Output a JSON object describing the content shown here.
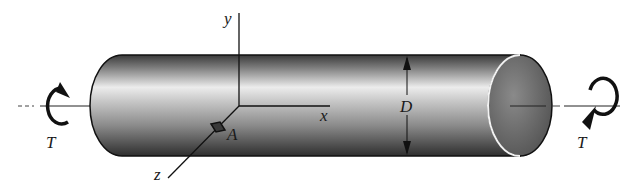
{
  "diagram": {
    "labels": {
      "y_axis": "y",
      "x_axis": "x",
      "z_axis": "z",
      "point": "A",
      "diameter": "D",
      "torque_left": "T",
      "torque_right": "T"
    },
    "colors": {
      "outline": "#111111",
      "shade_dark": "#2a2a2a",
      "shade_light": "#e6e6e6",
      "end_face": "#6e6e6e"
    }
  }
}
